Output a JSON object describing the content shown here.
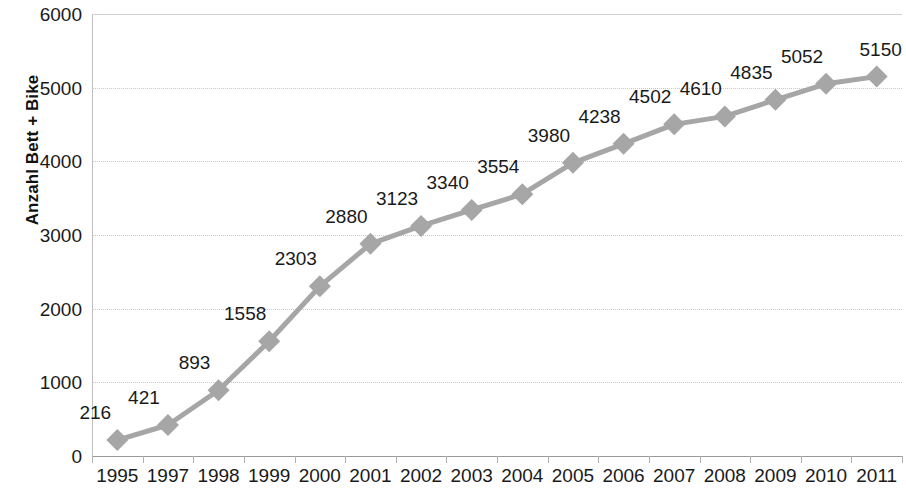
{
  "chart_data": {
    "type": "line",
    "title": "",
    "xlabel": "",
    "ylabel": "Anzahl Bett + Bike",
    "ylim": [
      0,
      6000
    ],
    "ytick_step": 1000,
    "yticks": [
      "0",
      "1000",
      "2000",
      "3000",
      "4000",
      "5000",
      "6000"
    ],
    "grid": true,
    "legend": "none",
    "marker": "diamond",
    "series_color": "#a6a6a6",
    "gridline_color": "#c8c8c8",
    "axis_color": "#9a9a9a",
    "label_color": "#1a1a1a",
    "data_labels_shown": true,
    "categories": [
      "1995",
      "1997",
      "1998",
      "1999",
      "2000",
      "2001",
      "2002",
      "2003",
      "2004",
      "2005",
      "2006",
      "2007",
      "2008",
      "2009",
      "2010",
      "2011"
    ],
    "values": [
      216,
      421,
      893,
      1558,
      2303,
      2880,
      3123,
      3340,
      3554,
      3980,
      4238,
      4502,
      4610,
      4835,
      5052,
      5150
    ],
    "series": [
      {
        "name": "Anzahl Bett + Bike",
        "values": [
          216,
          421,
          893,
          1558,
          2303,
          2880,
          3123,
          3340,
          3554,
          3980,
          4238,
          4502,
          4610,
          4835,
          5052,
          5150
        ]
      }
    ],
    "data_labels": [
      "216",
      "421",
      "893",
      "1558",
      "2303",
      "2880",
      "3123",
      "3340",
      "3554",
      "3980",
      "4238",
      "4502",
      "4610",
      "4835",
      "5052",
      "5150"
    ]
  }
}
